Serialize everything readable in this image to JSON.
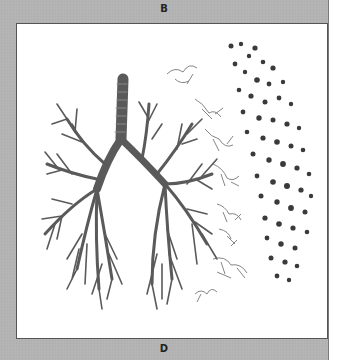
{
  "figure": {
    "label_top": "B",
    "label_bottom": "D"
  },
  "colors": {
    "panel_bg": "#b4b4b4",
    "figure_bg": "#ffffff",
    "tree": "#555555",
    "alveoli": "#3a3a3a"
  }
}
